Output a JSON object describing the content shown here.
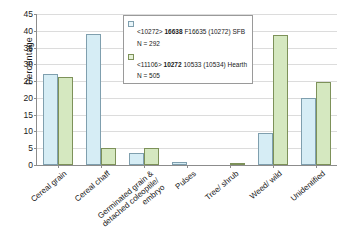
{
  "chart_data": {
    "type": "bar",
    "title": "",
    "xlabel": "",
    "ylabel": "Percentage",
    "ylim": [
      0,
      45
    ],
    "ystep": 5,
    "ytick_labels": [
      "0",
      "5",
      "10",
      "15",
      "20",
      "25",
      "30",
      "35",
      "40",
      "45"
    ],
    "grid": true,
    "legend_position": "top-center",
    "categories": [
      "Cereal grain",
      "Cereal chaff",
      "Germinated grain &\ndetached coleoptile/\nembryo",
      "Pulses",
      "Tree/ shrub",
      "Weed/ wild",
      "Unidentified"
    ],
    "series": [
      {
        "name": "<10272> 16638 F16635 (10272) SFB",
        "name_prefix": "<10272>",
        "name_bold": "16638",
        "name_suffix": "F16635 (10272) SFB",
        "n_label": "N = 292",
        "n": 292,
        "color": "#d6edf5",
        "edge_color": "#7f9fae",
        "values": [
          27.1,
          39.1,
          3.5,
          1.0,
          0,
          9.5,
          20.1
        ]
      },
      {
        "name": "<11106> 10272 10533 (10534) Hearth",
        "name_prefix": "<11106>",
        "name_bold": "10272",
        "name_suffix": "10533 (10534) Hearth",
        "n_label": "N = 505",
        "n": 505,
        "color": "#d5e8c0",
        "edge_color": "#7d9159",
        "values": [
          26.2,
          5.1,
          5.1,
          0,
          0.3,
          38.8,
          24.6
        ]
      }
    ]
  }
}
